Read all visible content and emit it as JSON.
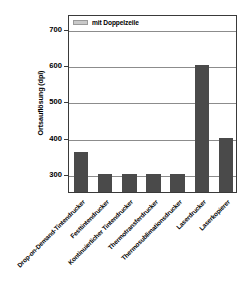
{
  "chart_data": {
    "type": "bar",
    "title": "",
    "xlabel": "",
    "ylabel": "Ortsauflösung (dpi)",
    "ylim": [
      250,
      740
    ],
    "yticks": [
      300,
      400,
      500,
      600,
      700
    ],
    "grid": true,
    "legend_position": "top-left",
    "categories": [
      "Drop-on-Demand-Tintendrucker",
      "Festtintendrucker",
      "Kontinuierlicher Tintendrucker",
      "Thermotransferdrucker",
      "Thermosublimationsdrucker",
      "Laserdrucker",
      "Laserkopierer"
    ],
    "series": [
      {
        "name": "mit Doppelzeile",
        "values": [
          360,
          300,
          300,
          300,
          300,
          600,
          400
        ],
        "color": "#4a4a4a"
      }
    ]
  },
  "legend": {
    "label": "mit Doppelzeile",
    "swatch_color": "#c9c9c9"
  },
  "axes": {
    "y_title": "Ortsauflösung (dpi)",
    "y_tick_labels": [
      "700",
      "600",
      "500",
      "400",
      "300"
    ]
  },
  "colors": {
    "bar": "#4a4a4a",
    "grid": "#8c8c8c",
    "frame": "#3a3a3a",
    "background": "#ffffff",
    "text": "#000000"
  }
}
